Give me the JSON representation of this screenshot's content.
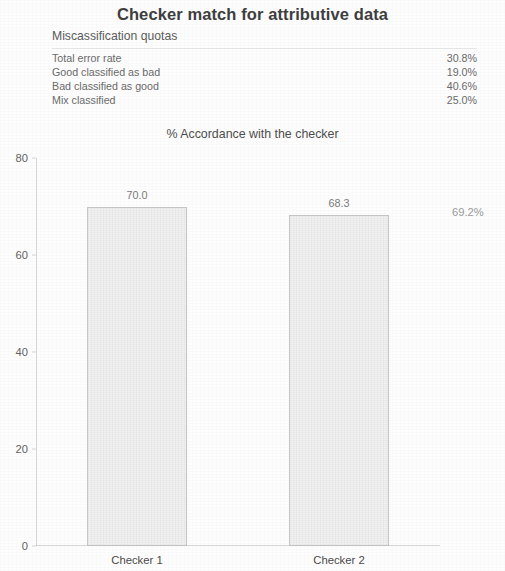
{
  "report": {
    "title": "Checker match for attributive data",
    "subtitle": "Miscassification quotas"
  },
  "quota_table": {
    "rows": [
      {
        "label": "Total error rate",
        "value": "30.8%"
      },
      {
        "label": "Good classified as bad",
        "value": "19.0%"
      },
      {
        "label": "Bad classified as good",
        "value": "40.6%"
      },
      {
        "label": "Mix classified",
        "value": "25.0%"
      }
    ]
  },
  "side_annotation": "69.2%",
  "chart_data": {
    "type": "bar",
    "title": "% Accordance with the checker",
    "categories": [
      "Checker 1",
      "Checker 2"
    ],
    "values": [
      70.0,
      68.3
    ],
    "data_labels": [
      "70.0",
      "68.3"
    ],
    "xlabel": "",
    "ylabel": "",
    "ylim": [
      0,
      80
    ],
    "yticks": [
      0,
      20,
      40,
      60,
      80
    ],
    "ytick_labels": [
      "0",
      "20",
      "40",
      "60",
      "80"
    ],
    "grid": false,
    "legend": false,
    "bar_fill": "#f1f1f1",
    "bar_border": "#969696"
  }
}
